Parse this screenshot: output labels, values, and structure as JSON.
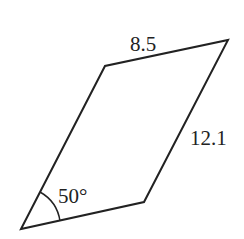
{
  "diagram": {
    "shape": "parallelogram",
    "vertices": {
      "bottom_left": [
        21,
        229
      ],
      "top_left": [
        105,
        66
      ],
      "top_right": [
        228,
        40
      ],
      "bottom_right": [
        144,
        202
      ]
    },
    "labels": {
      "top_side": "8.5",
      "right_side": "12.1",
      "angle": "50°"
    },
    "stroke_color": "#222222"
  }
}
